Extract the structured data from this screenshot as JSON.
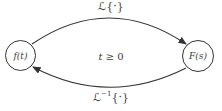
{
  "diagram": {
    "nodes": {
      "left": {
        "label": "f(t)"
      },
      "right": {
        "label": "F(s)"
      }
    },
    "arrows": {
      "forward": {
        "label": "ℒ{·}",
        "from": "f(t)",
        "to": "F(s)"
      },
      "inverse": {
        "label_base": "ℒ",
        "label_sup": "−1",
        "label_arg": "{·}",
        "from": "F(s)",
        "to": "f(t)"
      }
    },
    "condition": {
      "var": "t",
      "relation": " ≥ 0"
    },
    "colors": {
      "stroke": "#343434",
      "text": "#3c3c3c",
      "background": "#ffffff"
    }
  }
}
